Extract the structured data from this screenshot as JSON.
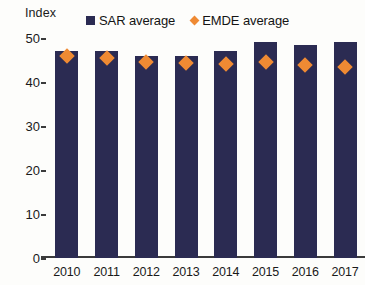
{
  "chart_data": {
    "type": "bar",
    "title": "",
    "ylabel": "Index",
    "xlabel": "",
    "ylim": [
      0,
      50
    ],
    "yticks": [
      0,
      10,
      20,
      30,
      40,
      50
    ],
    "grid": false,
    "legend_position": "top",
    "categories": [
      "2010",
      "2011",
      "2012",
      "2013",
      "2014",
      "2015",
      "2016",
      "2017"
    ],
    "series": [
      {
        "name": "SAR average",
        "type": "bar",
        "color": "#2b2b52",
        "marker": "square",
        "values": [
          47.0,
          47.0,
          46.0,
          46.0,
          47.0,
          49.0,
          48.5,
          49.0
        ]
      },
      {
        "name": "EMDE average",
        "type": "scatter",
        "color": "#ef8a33",
        "marker": "diamond",
        "values": [
          45.8,
          45.4,
          44.6,
          44.3,
          44.0,
          44.6,
          43.8,
          43.5
        ]
      }
    ]
  },
  "legend": {
    "entries": [
      {
        "label": "SAR average",
        "marker": "square-marker-icon"
      },
      {
        "label": "EMDE average",
        "marker": "diamond-marker-icon"
      }
    ]
  },
  "axis": {
    "y_title": "Index"
  }
}
